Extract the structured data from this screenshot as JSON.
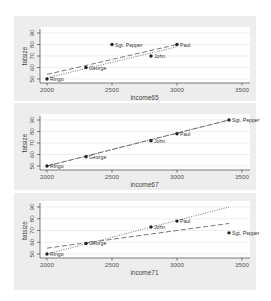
{
  "chart_data": [
    {
      "type": "scatter",
      "title": "",
      "xlabel": "income65",
      "ylabel": "fatsize",
      "xlim": [
        2000,
        3500
      ],
      "ylim": [
        50,
        90
      ],
      "xticks": [
        2000,
        2500,
        3000,
        3500
      ],
      "yticks": [
        50,
        60,
        70,
        80,
        90
      ],
      "grid": true,
      "points": [
        {
          "label": "Ringo",
          "x": 2000,
          "y": 50
        },
        {
          "label": "George",
          "x": 2300,
          "y": 60
        },
        {
          "label": "Sgt. Pepper",
          "x": 2500,
          "y": 80
        },
        {
          "label": "John",
          "x": 2800,
          "y": 70
        },
        {
          "label": "Paul",
          "x": 3000,
          "y": 80
        }
      ],
      "lines": [
        {
          "style": "dashed",
          "x": [
            2000,
            3000
          ],
          "y": [
            54,
            80
          ]
        },
        {
          "style": "dotted",
          "x": [
            2000,
            3000
          ],
          "y": [
            51,
            78
          ]
        }
      ]
    },
    {
      "type": "scatter",
      "title": "",
      "xlabel": "income67",
      "ylabel": "fatsize",
      "xlim": [
        2000,
        3500
      ],
      "ylim": [
        50,
        90
      ],
      "xticks": [
        2000,
        2500,
        3000,
        3500
      ],
      "yticks": [
        50,
        60,
        70,
        80,
        90
      ],
      "grid": true,
      "points": [
        {
          "label": "Ringo",
          "x": 2000,
          "y": 50
        },
        {
          "label": "George",
          "x": 2300,
          "y": 58
        },
        {
          "label": "John",
          "x": 2800,
          "y": 72
        },
        {
          "label": "Paul",
          "x": 3000,
          "y": 78
        },
        {
          "label": "Sgt. Pepper",
          "x": 3400,
          "y": 90
        }
      ],
      "lines": [
        {
          "style": "dashed",
          "x": [
            2000,
            3400
          ],
          "y": [
            50,
            90
          ]
        },
        {
          "style": "dotted",
          "x": [
            2000,
            3400
          ],
          "y": [
            50,
            90
          ]
        }
      ]
    },
    {
      "type": "scatter",
      "title": "",
      "xlabel": "income71",
      "ylabel": "fatsize",
      "xlim": [
        2000,
        3500
      ],
      "ylim": [
        50,
        90
      ],
      "xticks": [
        2000,
        2500,
        3000,
        3500
      ],
      "yticks": [
        50,
        60,
        70,
        80,
        90
      ],
      "grid": true,
      "points": [
        {
          "label": "Ringo",
          "x": 2000,
          "y": 50
        },
        {
          "label": "George",
          "x": 2300,
          "y": 59
        },
        {
          "label": "John",
          "x": 2800,
          "y": 73
        },
        {
          "label": "Paul",
          "x": 3000,
          "y": 78
        },
        {
          "label": "Sgt. Pepper",
          "x": 3400,
          "y": 68
        }
      ],
      "lines": [
        {
          "style": "dashed",
          "x": [
            2000,
            3400
          ],
          "y": [
            55,
            76
          ]
        },
        {
          "style": "dotted",
          "x": [
            2000,
            3400
          ],
          "y": [
            50,
            90
          ]
        }
      ]
    }
  ]
}
